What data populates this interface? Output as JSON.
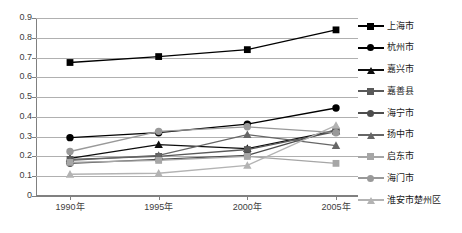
{
  "chart_data": {
    "type": "line",
    "title": "",
    "subtitle": "",
    "xlabel": "",
    "ylabel": "",
    "categories": [
      "1990年",
      "1995年",
      "2000年",
      "2005年"
    ],
    "ylim": [
      0,
      0.9
    ],
    "ytick_labels": [
      "0.9",
      "0.8",
      "0.7",
      "0.6",
      "0.5",
      "0.4",
      "0.3",
      "0.2",
      "0.1",
      "0"
    ],
    "ytick_values": [
      0.9,
      0.8,
      0.7,
      0.6,
      0.5,
      0.4,
      0.3,
      0.2,
      0.1,
      0
    ],
    "grid": true,
    "legend_position": "right",
    "series": [
      {
        "name": "上海市",
        "marker": "square",
        "color": "#000000",
        "values": [
          0.675,
          0.705,
          0.74,
          0.84
        ]
      },
      {
        "name": "杭州市",
        "marker": "circle",
        "color": "#000000",
        "values": [
          0.295,
          0.32,
          0.363,
          0.445
        ]
      },
      {
        "name": "嘉兴市",
        "marker": "triangle",
        "color": "#0d0d0d",
        "values": [
          0.19,
          0.26,
          0.24,
          0.33
        ]
      },
      {
        "name": "嘉善县",
        "marker": "square",
        "color": "#595959",
        "values": [
          0.185,
          0.2,
          0.235,
          0.325
        ]
      },
      {
        "name": "海宁市",
        "marker": "circle",
        "color": "#4d4d4d",
        "values": [
          0.165,
          0.185,
          0.205,
          0.335
        ]
      },
      {
        "name": "扬中市",
        "marker": "triangle",
        "color": "#666666",
        "values": [
          0.18,
          0.205,
          0.31,
          0.255
        ]
      },
      {
        "name": "启东市",
        "marker": "square",
        "color": "#a6a6a6",
        "values": [
          0.17,
          0.18,
          0.2,
          0.165
        ]
      },
      {
        "name": "海门市",
        "marker": "circle",
        "color": "#999999",
        "values": [
          0.225,
          0.327,
          0.35,
          0.32
        ]
      },
      {
        "name": "淮安市楚州区",
        "marker": "triangle",
        "color": "#b3b3b3",
        "values": [
          0.11,
          0.115,
          0.155,
          0.357
        ]
      }
    ]
  },
  "style": {
    "background": "#ffffff",
    "gridline_color": "#b0b0b0",
    "axis_color": "#808080",
    "tick_label_color": "#404040",
    "legend_text_color": "#1a1a1a"
  }
}
